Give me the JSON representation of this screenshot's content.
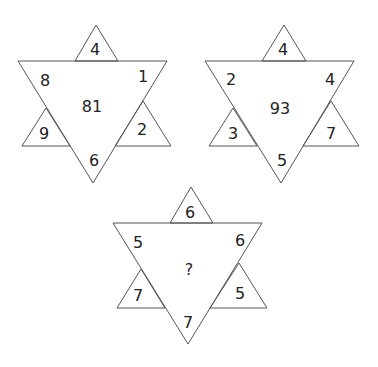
{
  "puzzle": {
    "stars": [
      {
        "name": "star-1",
        "top": "4",
        "upper_left": "8",
        "upper_right": "1",
        "lower_left": "9",
        "lower_right": "2",
        "bottom": "6",
        "center": "81"
      },
      {
        "name": "star-2",
        "top": "4",
        "upper_left": "2",
        "upper_right": "4",
        "lower_left": "3",
        "lower_right": "7",
        "bottom": "5",
        "center": "93"
      },
      {
        "name": "star-3",
        "top": "6",
        "upper_left": "5",
        "upper_right": "6",
        "lower_left": "7",
        "lower_right": "5",
        "bottom": "7",
        "center": "?"
      }
    ],
    "colors": {
      "stroke": "#555555",
      "text": "#222222",
      "background": "#ffffff"
    }
  }
}
